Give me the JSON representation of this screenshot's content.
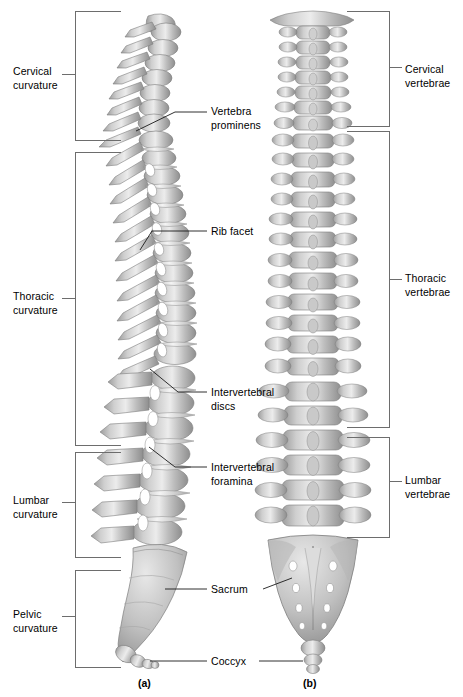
{
  "figure": {
    "panels": [
      {
        "id": "a",
        "caption": "(a)",
        "view": "lateral"
      },
      {
        "id": "b",
        "caption": "(b)",
        "view": "posterior"
      }
    ],
    "colors": {
      "bone_light": "#f2f2f2",
      "bone_mid": "#b6b6b6",
      "bone_dark": "#8d8d8d",
      "outline": "#7e7e7e",
      "bracket": "#6d6d6d",
      "leader": "#1a1a1a",
      "text": "#000000",
      "background": "#ffffff"
    }
  },
  "left_brackets": [
    {
      "id": "cervical-curvature",
      "label": "Cervical\ncurvature",
      "top": 11,
      "height": 130,
      "label_top": 65
    },
    {
      "id": "thoracic-curvature",
      "label": "Thoracic\ncurvature",
      "top": 152,
      "height": 294,
      "label_top": 286
    },
    {
      "id": "lumbar-curvature",
      "label": "Lumbar\ncurvature",
      "top": 452,
      "height": 106,
      "label_top": 488
    },
    {
      "id": "pelvic-curvature",
      "label": "Pelvic\ncurvature",
      "top": 570,
      "height": 98,
      "label_top": 605
    }
  ],
  "right_brackets": [
    {
      "id": "cervical-vertebrae",
      "label": "Cervical\nvertebrae",
      "top": 11,
      "height": 116,
      "label_top": 63
    },
    {
      "id": "thoracic-vertebrae",
      "label": "Thoracic\nvertebrae",
      "top": 131,
      "height": 297,
      "label_top": 272
    },
    {
      "id": "lumbar-vertebrae",
      "label": "Lumbar\nvertebrae",
      "top": 437,
      "height": 101,
      "label_top": 474
    }
  ],
  "center_labels": [
    {
      "id": "vertebra-prominens",
      "label": "Vertebra\nprominens",
      "left": 211,
      "top": 101
    },
    {
      "id": "rib-facet",
      "label": "Rib facet",
      "left": 211,
      "top": 225
    },
    {
      "id": "intervertebral-discs",
      "label": "Intervertebral\ndiscs",
      "left": 211,
      "top": 386
    },
    {
      "id": "intervertebral-foramina",
      "label": "Intervertebral\nforamina",
      "left": 211,
      "top": 461
    },
    {
      "id": "sacrum",
      "label": "Sacrum",
      "left": 211,
      "top": 583
    },
    {
      "id": "coccyx",
      "label": "Coccyx",
      "left": 211,
      "top": 655
    }
  ],
  "captions": [
    {
      "id": "caption-a",
      "text": "(a)",
      "left": 138,
      "top": 677
    },
    {
      "id": "caption-b",
      "text": "(b)",
      "left": 303,
      "top": 677
    }
  ]
}
